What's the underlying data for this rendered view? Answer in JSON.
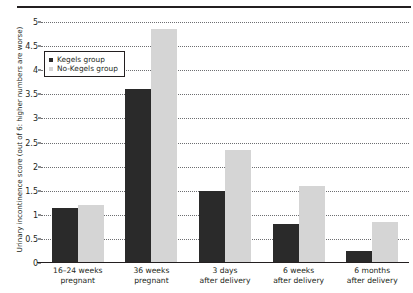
{
  "chart_data": {
    "type": "bar",
    "title": "",
    "xlabel": "",
    "ylabel": "Urinary incontinence score (out of 6: higher numbers are worse)",
    "ylim": [
      0,
      5
    ],
    "ytick_step": 0.5,
    "yticks": [
      "0",
      "0.5",
      "1",
      "1.5",
      "2",
      "2.5",
      "3",
      "3.5",
      "4",
      "4.5",
      "5"
    ],
    "grid": true,
    "legend_position": "upper-left-inside",
    "categories": [
      "16–24 weeks pregnant",
      "36 weeks pregnant",
      "3 days after delivery",
      "6 weeks after delivery",
      "6 months after delivery"
    ],
    "categories_lines": [
      [
        "16–24 weeks",
        "pregnant"
      ],
      [
        "36 weeks",
        "pregnant"
      ],
      [
        "3 days",
        "after delivery"
      ],
      [
        "6 weeks",
        "after delivery"
      ],
      [
        "6 months",
        "after delivery"
      ]
    ],
    "series": [
      {
        "name": "Kegels group",
        "color": "#2a2a2a",
        "values": [
          1.15,
          3.6,
          1.5,
          0.8,
          0.25
        ]
      },
      {
        "name": "No-Kegels group",
        "color": "#d5d5d5",
        "values": [
          1.2,
          4.85,
          2.35,
          1.6,
          0.85
        ]
      }
    ]
  },
  "legend": {
    "items": [
      {
        "label": "Kegels group",
        "swatch": "dark-square-marker"
      },
      {
        "label": "No-Kegels group",
        "swatch": "light-square-marker"
      }
    ]
  },
  "axis": {
    "y_title": "Urinary incontinence score (out of 6: higher numbers are worse)"
  },
  "decoration": {
    "top_rule": "horizontal-rule"
  }
}
